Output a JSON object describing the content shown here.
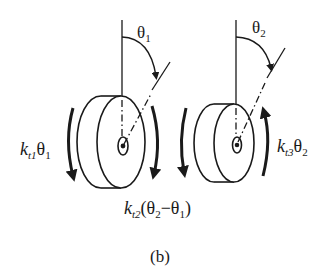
{
  "figure": {
    "caption": "(b)",
    "background": "#ffffff",
    "stroke_color": "#1a1a1a"
  },
  "disk1": {
    "angle_label": {
      "base": "θ",
      "sub": "1"
    },
    "torque_left": {
      "k": "k",
      "ksub": "t1",
      "theta": "θ",
      "thsub": "1"
    },
    "torque_right": {
      "k": "k",
      "ksub": "t2",
      "open": "(θ",
      "sub2": "2",
      "minus": "−θ",
      "sub1": "1",
      "close": ")"
    }
  },
  "disk2": {
    "angle_label": {
      "base": "θ",
      "sub": "2"
    },
    "torque_right": {
      "k": "k",
      "ksub": "t3",
      "theta": "θ",
      "thsub": "2"
    }
  }
}
